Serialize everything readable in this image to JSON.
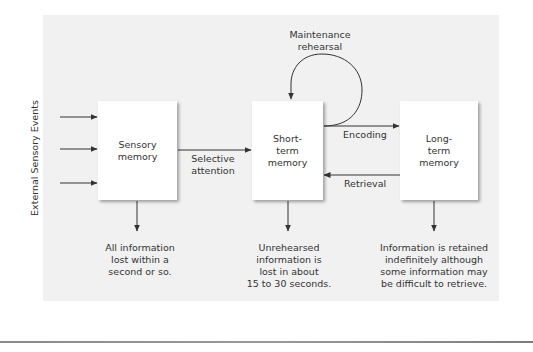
{
  "diagram": {
    "side_label": "External Sensory Events",
    "boxes": [
      {
        "id": "sensory",
        "lines": [
          "Sensory",
          "memory"
        ]
      },
      {
        "id": "short",
        "lines": [
          "Short-",
          "term",
          "memory"
        ]
      },
      {
        "id": "long",
        "lines": [
          "Long-",
          "term",
          "memory"
        ]
      }
    ],
    "edges": [
      {
        "from": "external",
        "to": "sensory",
        "count": 3
      },
      {
        "from": "sensory",
        "to": "short",
        "label_lines": [
          "Selective",
          "attention"
        ]
      },
      {
        "from": "short",
        "to": "short",
        "label_lines": [
          "Maintenance",
          "rehearsal"
        ]
      },
      {
        "from": "short",
        "to": "long",
        "label": "Encoding"
      },
      {
        "from": "long",
        "to": "short",
        "label": "Retrieval"
      }
    ],
    "notes": [
      {
        "under": "sensory",
        "lines": [
          "All information",
          "lost within a",
          "second or so."
        ]
      },
      {
        "under": "short",
        "lines": [
          "Unrehearsed",
          "information is",
          "lost in about",
          "15 to 30 seconds."
        ]
      },
      {
        "under": "long",
        "lines": [
          "Information is retained",
          "indefinitely although",
          "some information may",
          "be difficult to retrieve."
        ]
      }
    ],
    "colors": {
      "panel": "#f1f1f1",
      "box": "#ffffff",
      "stroke": "#333333",
      "text": "#333333"
    }
  }
}
